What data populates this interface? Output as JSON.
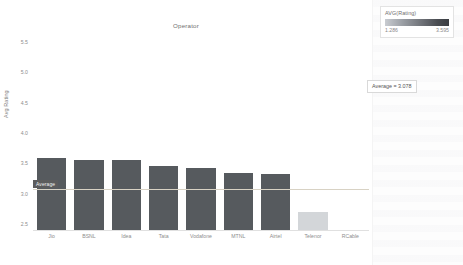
{
  "chart_data": {
    "type": "bar",
    "title": "Operator",
    "xlabel": "",
    "ylabel": "Avg Rating",
    "ylim": [
      2.4,
      5.6
    ],
    "yticks": [
      "5.5",
      "5.0",
      "4.5",
      "4.0",
      "3.5",
      "3.0",
      "2.5"
    ],
    "ytick_values": [
      5.5,
      5.0,
      4.5,
      4.0,
      3.5,
      3.0,
      2.5
    ],
    "grid": false,
    "categories": [
      "Jio",
      "BSNL",
      "Idea",
      "Tata",
      "Vodafone",
      "MTNL",
      "Airtel",
      "Telenor",
      "RCable"
    ],
    "values": [
      3.595,
      3.56,
      3.555,
      3.455,
      3.43,
      3.34,
      3.33,
      2.7,
      1.286
    ],
    "bar_colors": [
      "#565a5e",
      "#565a5e",
      "#565a5e",
      "#565a5e",
      "#565a5e",
      "#565a5e",
      "#565a5e",
      "#d3d6d9",
      "#4e5257"
    ],
    "series": [
      {
        "name": "AVG(Rating)",
        "values": [
          3.595,
          3.56,
          3.555,
          3.455,
          3.43,
          3.34,
          3.33,
          2.7,
          1.286
        ]
      }
    ],
    "reference_line": {
      "label": "Average",
      "callout": "Average = 3.078",
      "value": 3.078
    },
    "legend": {
      "title": "AVG(Rating)",
      "min": "1.286",
      "max": "3.595",
      "position": "top-right",
      "gradient_from": "#c9ccd1",
      "gradient_to": "#3a3d42"
    }
  },
  "colors": {
    "bar_dark": "#565a5e",
    "bar_light": "#d3d6d9",
    "reference_badge": "#5c5c5c",
    "axis_text": "#8e8e8e",
    "title_text": "#707070"
  }
}
